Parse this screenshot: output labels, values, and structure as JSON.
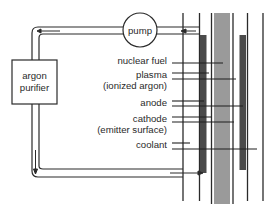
{
  "diagram": {
    "type": "thermionic converter schematic",
    "colors": {
      "line": "#2a2a2a",
      "dark_bar": "#4a4a4a",
      "gray_bar": "#9a9a9a",
      "background": "#ffffff"
    },
    "components": {
      "pump": {
        "label": "pump"
      },
      "purifier": {
        "label_line1": "argon",
        "label_line2": "purifier"
      }
    },
    "labels": [
      {
        "id": "nuclear-fuel",
        "line1": "nuclear fuel",
        "line2": ""
      },
      {
        "id": "plasma",
        "line1": "plasma",
        "line2": "(ionized argon)"
      },
      {
        "id": "anode",
        "line1": "anode",
        "line2": ""
      },
      {
        "id": "cathode",
        "line1": "cathode",
        "line2": "(emitter surface)"
      },
      {
        "id": "coolant",
        "line1": "coolant",
        "line2": ""
      }
    ]
  }
}
